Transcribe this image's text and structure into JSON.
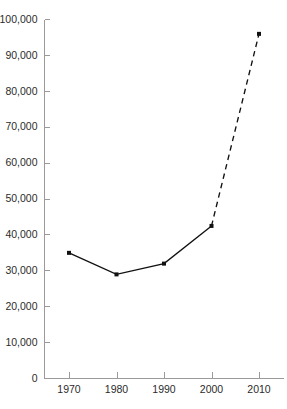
{
  "chart_data": {
    "type": "line",
    "title": "",
    "xlabel": "",
    "ylabel": "",
    "categories": [
      "1970",
      "1980",
      "1990",
      "2000",
      "2010"
    ],
    "x": [
      1970,
      1980,
      1990,
      2000,
      2010
    ],
    "values": [
      35000,
      29000,
      32000,
      42500,
      96000
    ],
    "series": [
      {
        "name": "Observed",
        "style": "solid",
        "x": [
          1970,
          1980,
          1990,
          2000
        ],
        "values": [
          35000,
          29000,
          32000,
          42500
        ]
      },
      {
        "name": "Projected",
        "style": "dashed",
        "x": [
          2000,
          2010
        ],
        "values": [
          42500,
          96000
        ]
      }
    ],
    "xlim": [
      1965,
      2015
    ],
    "ylim": [
      0,
      100000
    ],
    "ytick_labels": [
      "0",
      "10,000",
      "20,000",
      "30,000",
      "40,000",
      "50,000",
      "60,000",
      "70,000",
      "80,000",
      "90,000",
      "100,000"
    ],
    "ytick_values": [
      0,
      10000,
      20000,
      30000,
      40000,
      50000,
      60000,
      70000,
      80000,
      90000,
      100000
    ],
    "xtick_labels": [
      "1970",
      "1980",
      "1990",
      "2000",
      "2010"
    ],
    "grid": false,
    "legend": "none",
    "marker": "square",
    "line_color": "#111111",
    "axis_color": "#9a9a9a",
    "label_color": "#2b2b2b",
    "background_color": "#ffffff"
  }
}
